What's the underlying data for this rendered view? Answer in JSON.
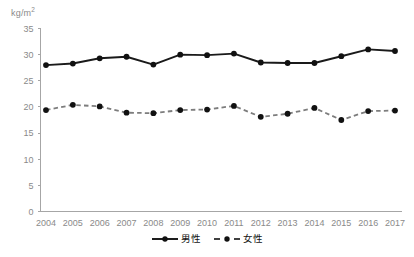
{
  "chart_data": {
    "type": "line",
    "title": "",
    "subtitle": "",
    "xlabel": "",
    "ylabel": "kg/m2",
    "unit_label": "kg/m",
    "unit_exponent": "2",
    "categories": [
      "2004",
      "2005",
      "2006",
      "2007",
      "2008",
      "2009",
      "2010",
      "2011",
      "2012",
      "2013",
      "2014",
      "2015",
      "2016",
      "2017"
    ],
    "x": [
      2004,
      2005,
      2006,
      2007,
      2008,
      2009,
      2010,
      2011,
      2012,
      2013,
      2014,
      2015,
      2016,
      2017
    ],
    "series": [
      {
        "name": "男性",
        "style": "solid",
        "color": "#1a1a1a",
        "values": [
          28.0,
          28.3,
          29.3,
          29.6,
          28.1,
          30.0,
          29.9,
          30.2,
          28.5,
          28.4,
          28.4,
          29.7,
          31.0,
          30.7
        ]
      },
      {
        "name": "女性",
        "style": "dashed",
        "color": "#7d7d7d",
        "values": [
          19.4,
          20.4,
          20.1,
          18.9,
          18.8,
          19.4,
          19.5,
          20.2,
          18.1,
          18.7,
          19.8,
          17.5,
          19.2,
          19.3
        ]
      }
    ],
    "ylim": [
      0,
      35
    ],
    "yticks": [
      0,
      5,
      10,
      15,
      20,
      25,
      30,
      35
    ],
    "ytick_labels": [
      "0",
      "5",
      "10",
      "15",
      "20",
      "25",
      "30",
      "35"
    ],
    "grid": false,
    "legend_position": "bottom-center",
    "axis_color": "#a6a6a6",
    "tick_label_color": "#8a8a8a"
  },
  "legend": {
    "entries": [
      {
        "label": "男性",
        "icon": "solid-line-with-dot-marker"
      },
      {
        "label": "女性",
        "icon": "dashed-line-with-dot-marker"
      }
    ]
  }
}
